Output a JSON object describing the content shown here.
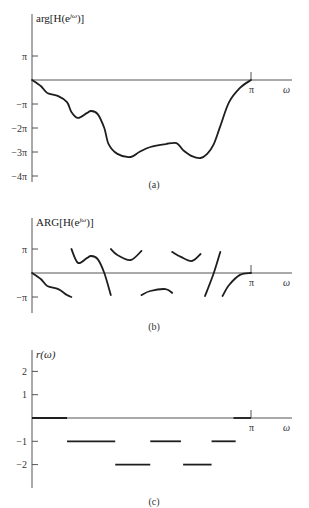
{
  "chart_data": [
    {
      "type": "line",
      "panel": "(a)",
      "title": "arg[H(e^{jω})]",
      "ylabel_main": "arg[H(e",
      "ylabel_sup": "jω",
      "ylabel_tail": ")]",
      "xlabel": "ω",
      "x_ticks": [
        "π"
      ],
      "y_ticks": [
        "π",
        "−π",
        "−2π",
        "−3π",
        "−4π"
      ],
      "y_tick_values_pi": [
        1,
        -1,
        -2,
        -3,
        -4
      ],
      "xlim_pi": [
        0,
        1
      ],
      "ylim_pi": [
        -4.3,
        2.8
      ],
      "x_pi": [
        0,
        0.04,
        0.07,
        0.12,
        0.16,
        0.18,
        0.21,
        0.25,
        0.27,
        0.3,
        0.33,
        0.35,
        0.39,
        0.45,
        0.49,
        0.54,
        0.61,
        0.66,
        0.69,
        0.73,
        0.77,
        0.8,
        0.83,
        0.86,
        0.9,
        0.95,
        1.0
      ],
      "y_pi": [
        0,
        -0.25,
        -0.54,
        -0.67,
        -0.92,
        -1.33,
        -1.58,
        -1.38,
        -1.29,
        -1.42,
        -2.0,
        -2.67,
        -3.08,
        -3.21,
        -3.0,
        -2.79,
        -2.67,
        -2.63,
        -2.92,
        -3.17,
        -3.25,
        -3.08,
        -2.67,
        -1.92,
        -0.92,
        -0.33,
        0
      ]
    },
    {
      "type": "line",
      "panel": "(b)",
      "title": "ARG[H(e^{jω})]",
      "ylabel_main": "ARG[H(e",
      "ylabel_sup": "jω",
      "ylabel_tail": ")]",
      "xlabel": "ω",
      "x_ticks": [
        "π"
      ],
      "y_ticks": [
        "π",
        "−π"
      ],
      "y_tick_values_pi": [
        1,
        -1
      ],
      "xlim_pi": [
        0,
        1
      ],
      "ylim_pi": [
        -1.7,
        2.3
      ],
      "segments": [
        {
          "x_pi": [
            0,
            0.04,
            0.07,
            0.12,
            0.16,
            0.18
          ],
          "y_pi": [
            0,
            -0.25,
            -0.54,
            -0.67,
            -0.92,
            -1.0
          ]
        },
        {
          "x_pi": [
            0.18,
            0.21,
            0.25,
            0.27,
            0.3,
            0.33,
            0.36
          ],
          "y_pi": [
            1.0,
            0.42,
            0.62,
            0.71,
            0.58,
            0.0,
            -0.92
          ]
        },
        {
          "x_pi": [
            0.36,
            0.39,
            0.45,
            0.5
          ],
          "y_pi": [
            1.0,
            0.75,
            0.54,
            0.92
          ]
        },
        {
          "x_pi": [
            0.5,
            0.54,
            0.61,
            0.64
          ],
          "y_pi": [
            -0.92,
            -0.75,
            -0.67,
            -0.83
          ]
        },
        {
          "x_pi": [
            0.64,
            0.68,
            0.73,
            0.77
          ],
          "y_pi": [
            0.88,
            0.67,
            0.5,
            0.79
          ]
        },
        {
          "x_pi": [
            0.79,
            0.83,
            0.86
          ],
          "y_pi": [
            -0.96,
            0.0,
            0.88
          ]
        },
        {
          "x_pi": [
            0.87,
            0.9,
            0.95,
            1.0
          ],
          "y_pi": [
            -0.96,
            -0.5,
            -0.08,
            0
          ]
        }
      ]
    },
    {
      "type": "step",
      "panel": "(c)",
      "title": "r(ω)",
      "ylabel": "r(ω)",
      "xlabel": "ω",
      "x_ticks": [
        "π"
      ],
      "y_ticks": [
        "2",
        "1",
        "−1",
        "−2"
      ],
      "y_tick_values": [
        2,
        1,
        -1,
        -2
      ],
      "xlim_pi": [
        0,
        1
      ],
      "ylim": [
        -3,
        3
      ],
      "segments": [
        {
          "x0_pi": 0.0,
          "x1_pi": 0.16,
          "y": 0
        },
        {
          "x0_pi": 0.16,
          "x1_pi": 0.38,
          "y": -1
        },
        {
          "x0_pi": 0.38,
          "x1_pi": 0.54,
          "y": -2
        },
        {
          "x0_pi": 0.54,
          "x1_pi": 0.68,
          "y": -1
        },
        {
          "x0_pi": 0.69,
          "x1_pi": 0.82,
          "y": -2
        },
        {
          "x0_pi": 0.82,
          "x1_pi": 0.93,
          "y": -1
        },
        {
          "x0_pi": 0.92,
          "x1_pi": 1.0,
          "y": 0
        }
      ]
    }
  ],
  "captions": [
    "(a)",
    "(b)",
    "(c)"
  ],
  "colors": {
    "line": "#1e1e1e",
    "axis": "#555555",
    "label": "#333333"
  },
  "layout": {
    "x0": 32,
    "xpi": 251,
    "xend": 292,
    "panels": [
      {
        "top": 14,
        "zero": 80,
        "unit": 24,
        "bottom": 182,
        "caption_y": 188
      },
      {
        "top": 218,
        "zero": 273,
        "unit": 24,
        "bottom": 313,
        "caption_y": 330
      },
      {
        "top": 350,
        "zero": 418,
        "unit": 23.3,
        "bottom": 488,
        "caption_y": 505
      }
    ]
  }
}
